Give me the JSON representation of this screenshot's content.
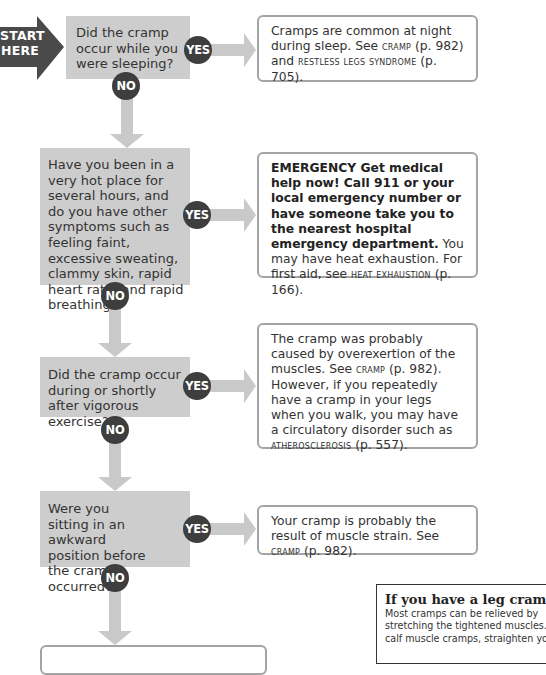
{
  "start": {
    "line1": "START",
    "line2": "HERE"
  },
  "colors": {
    "question_bg": "#cdcdcd",
    "arrow": "#c9c9c9",
    "badge": "#3e3e3e",
    "start_arrow": "#4a4a4a",
    "answer_border": "#a4a4a4"
  },
  "labels": {
    "yes": "YES",
    "no": "NO"
  },
  "questions": [
    {
      "text": "Did the cramp occur while you were sleeping?"
    },
    {
      "text": "Have you been in a very hot place for several hours, and do you have other symptoms such as feeling faint, excessive sweating, clammy skin, rapid heart rate, and rapid breathing?"
    },
    {
      "text": "Did the cramp occur during or shortly after vigorous exercise?"
    },
    {
      "text": "Were you sitting in an awkward position before the cramp occurred?"
    }
  ],
  "answers": [
    {
      "pre": "Cramps are common at night during sleep. See ",
      "ref1": "CRAMP",
      "mid": " (p. 982) and ",
      "ref2": "RESTLESS LEGS SYNDROME",
      "post": " (p. 705)."
    },
    {
      "bold": "EMERGENCY  Get medical help now! Call 911 or your local emergency number or have someone take you to the nearest hospital emergency department.",
      "pre": " You may have heat exhaustion. For first aid, see ",
      "ref1": "HEAT EXHAUSTION",
      "post": " (p. 166)."
    },
    {
      "pre": "The cramp was probably caused by overexertion of the muscles. See ",
      "ref1": "CRAMP",
      "mid": " (p. 982). However, if you repeatedly have a cramp in your legs when you walk, you may have a circulatory disorder such as ",
      "ref2": "ATHEROSCLEROSIS",
      "post": " (p. 557)."
    },
    {
      "pre": "Your cramp is probably the result of muscle strain. See ",
      "ref1": "CRAMP",
      "post": " (p. 982)."
    }
  ],
  "sidebar": {
    "title": "If you have a leg cram",
    "lines": [
      "Most cramps can be relieved by",
      "stretching the tightened muscles.",
      "calf muscle cramps, straighten yo"
    ]
  }
}
